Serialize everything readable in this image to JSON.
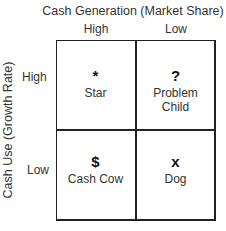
{
  "axes": {
    "x_title": "Cash Generation (Market Share)",
    "x_ticks": [
      "High",
      "Low"
    ],
    "y_title": "Cash Use (Growth Rate)",
    "y_ticks": [
      "High",
      "Low"
    ]
  },
  "quadrants": [
    {
      "symbol": "*",
      "label": "Star",
      "icon": "star-icon"
    },
    {
      "symbol": "?",
      "label": "Problem\nChild",
      "label_lines": [
        "Problem",
        "Child"
      ],
      "icon": "question-mark-icon"
    },
    {
      "symbol": "$",
      "label": "Cash Cow",
      "icon": "dollar-icon"
    },
    {
      "symbol": "x",
      "label": "Dog",
      "icon": "x-icon"
    }
  ]
}
